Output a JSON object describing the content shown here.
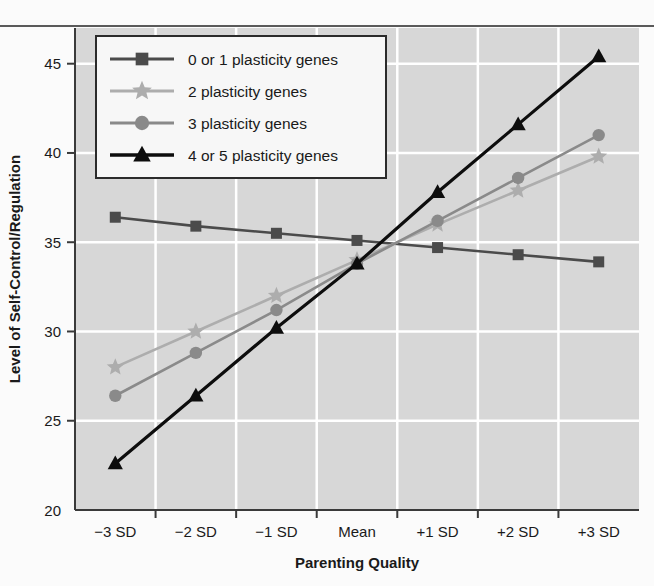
{
  "chart_data": {
    "type": "line",
    "title": "",
    "xlabel": "Parenting Quality",
    "ylabel": "Level of Self-Control/Regulation",
    "categories": [
      "−3 SD",
      "−2 SD",
      "−1 SD",
      "Mean",
      "+1 SD",
      "+2 SD",
      "+3 SD"
    ],
    "ylim": [
      20,
      47
    ],
    "yticks": [
      20,
      25,
      30,
      35,
      40,
      45
    ],
    "ytick_labels": [
      "20",
      "25",
      "30",
      "35",
      "40",
      "45"
    ],
    "grid": true,
    "legend_position": "upper-left",
    "series": [
      {
        "name": "0 or 1 plasticity genes",
        "marker": "square",
        "color": "#4b4b4b",
        "values": [
          36.4,
          35.9,
          35.5,
          35.1,
          34.7,
          34.3,
          33.9
        ]
      },
      {
        "name": "2 plasticity genes",
        "marker": "star",
        "color": "#adadad",
        "values": [
          28.0,
          30.0,
          32.0,
          34.0,
          36.0,
          37.9,
          39.8
        ]
      },
      {
        "name": "3 plasticity genes",
        "marker": "circle",
        "color": "#8a8a8a",
        "values": [
          26.4,
          28.8,
          31.2,
          33.8,
          36.2,
          38.6,
          41.0
        ]
      },
      {
        "name": "4 or 5 plasticity genes",
        "marker": "triangle",
        "color": "#0d0d0d",
        "values": [
          22.6,
          26.4,
          30.2,
          33.8,
          37.8,
          41.6,
          45.4
        ]
      }
    ]
  },
  "style": {
    "plot_background": "#d7d7d7",
    "gridline_color": "#ffffff",
    "axis_color": "#3a3a3a",
    "page_background": "#fbfbfb",
    "legend_background": "#f7f7f7",
    "legend_border": "#2b2b2b"
  }
}
